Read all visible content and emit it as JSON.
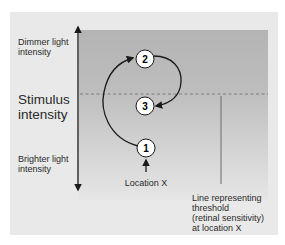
{
  "diagram": {
    "type": "threshold-staircase",
    "y_axis": {
      "title": "Stimulus intensity",
      "top_label": "Dimmer light intensity",
      "bottom_label": "Brighter light intensity"
    },
    "steps": [
      {
        "label": "1",
        "position": "below threshold line (bright)"
      },
      {
        "label": "2",
        "position": "above threshold line (dim)"
      },
      {
        "label": "3",
        "position": "just below threshold line"
      }
    ],
    "transitions": [
      {
        "from": "1",
        "to": "2"
      },
      {
        "from": "2",
        "to": "3"
      }
    ],
    "location_label": "Location X",
    "threshold_annotation": "Line representing threshold (retinal sensitivity) at location X",
    "threshold_annotation_lines": [
      "Line representing",
      "threshold",
      "(retinal sensitivity)",
      "at location X"
    ],
    "colors": {
      "panel_bg": "#e9e9e9",
      "region_top": "#b4b4b4",
      "region_bottom": "#e2e2e2",
      "line": "#1a1a1a",
      "dashed": "#7d7d7d",
      "circle_fill": "#ffffff"
    }
  }
}
